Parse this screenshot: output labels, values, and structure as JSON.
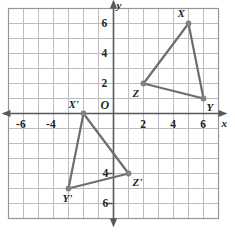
{
  "chart_data": {
    "type": "scatter",
    "title": "",
    "xlabel": "x",
    "ylabel": "y",
    "grid": true,
    "legend": "none",
    "origin_label": "O",
    "xlim": [
      -7,
      7
    ],
    "ylim": [
      -7,
      7
    ],
    "x_tick_labels": [
      "-6",
      "-4",
      "2",
      "4",
      "6"
    ],
    "x_ticks": [
      -6,
      -4,
      2,
      4,
      6
    ],
    "y_tick_labels": [
      "6",
      "4",
      "2",
      "4",
      "6"
    ],
    "y_ticks": [
      6,
      4,
      2,
      -4,
      -6
    ],
    "gridline_step": 1,
    "colors": {
      "grid": "#b9bcc0",
      "axis": "#58595b",
      "shape": "#6d6e71",
      "vertex": "#808285",
      "text": "#231f20",
      "border": "#939598"
    },
    "series": [
      {
        "name": "Triangle XYZ",
        "closed": true,
        "points": [
          {
            "label": "X",
            "x": 5,
            "y": 6,
            "label_dx": -11,
            "label_dy": -16
          },
          {
            "label": "Y",
            "x": 6,
            "y": 1,
            "label_dx": 3,
            "label_dy": 3
          },
          {
            "label": "Z",
            "x": 2,
            "y": 2,
            "label_dx": -11,
            "label_dy": 4
          }
        ]
      },
      {
        "name": "Triangle X'Y'Z'",
        "closed": true,
        "points": [
          {
            "label": "X'",
            "x": -2,
            "y": 0,
            "label_dx": -15,
            "label_dy": -15
          },
          {
            "label": "Y'",
            "x": -3,
            "y": -5,
            "label_dx": -6,
            "label_dy": 4
          },
          {
            "label": "Z'",
            "x": 1,
            "y": -4,
            "label_dx": 4,
            "label_dy": 3
          }
        ]
      }
    ]
  }
}
